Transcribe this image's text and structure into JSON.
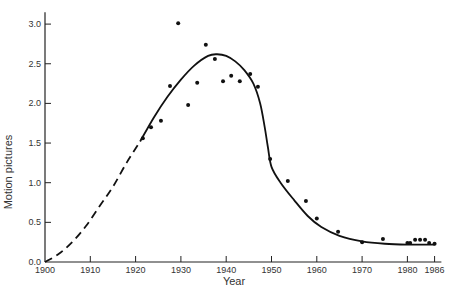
{
  "chart_data": {
    "type": "line",
    "title": "",
    "xlabel": "Year",
    "ylabel": "Motion pictures",
    "xlim": [
      1900,
      1987
    ],
    "ylim": [
      0,
      3.1
    ],
    "grid": false,
    "legend": null,
    "x_ticks": [
      1900,
      1910,
      1920,
      1930,
      1940,
      1950,
      1960,
      1970,
      1980,
      1986
    ],
    "x_tick_labels": [
      "1900",
      "1910",
      "1920",
      "1930",
      "1940",
      "1950",
      "1960",
      "1970",
      "1980",
      "1986"
    ],
    "y_ticks": [
      0.0,
      0.5,
      1.0,
      1.5,
      2.0,
      2.5,
      3.0
    ],
    "y_tick_labels": [
      "0.0",
      "0.5",
      "1.0",
      "1.5",
      "2.0",
      "2.5",
      "3.0"
    ],
    "series": [
      {
        "name": "observed",
        "style": "scatter",
        "x": [
          1921.6,
          1923.4,
          1925.6,
          1927.6,
          1929.4,
          1931.6,
          1933.6,
          1935.5,
          1937.5,
          1939.3,
          1941.1,
          1943.0,
          1945.3,
          1947.0,
          1949.7,
          1953.6,
          1957.6,
          1960.0,
          1964.7,
          1970.0,
          1974.6,
          1980.0,
          1980.6,
          1981.7,
          1982.8,
          1983.9,
          1984.8,
          1986.0
        ],
        "y": [
          1.56,
          1.7,
          1.78,
          2.22,
          3.01,
          1.98,
          2.26,
          2.74,
          2.56,
          2.28,
          2.35,
          2.28,
          2.37,
          2.21,
          1.3,
          1.02,
          0.77,
          0.55,
          0.38,
          0.25,
          0.29,
          0.24,
          0.24,
          0.28,
          0.28,
          0.28,
          0.24,
          0.23
        ]
      },
      {
        "name": "fitted curve (extrapolated)",
        "style": "dashed",
        "x": [
          1900,
          1903,
          1906,
          1909,
          1912,
          1915,
          1918,
          1921
        ],
        "y": [
          0.0,
          0.1,
          0.25,
          0.45,
          0.7,
          0.95,
          1.25,
          1.52
        ]
      },
      {
        "name": "fitted curve",
        "style": "solid",
        "x": [
          1921,
          1924,
          1927,
          1930,
          1933,
          1936,
          1938,
          1940,
          1942,
          1944,
          1946,
          1947.5,
          1948.5,
          1949.2,
          1950,
          1952,
          1955,
          1958,
          1961,
          1965,
          1970,
          1975,
          1980,
          1986
        ],
        "y": [
          1.52,
          1.82,
          2.08,
          2.3,
          2.48,
          2.6,
          2.62,
          2.6,
          2.53,
          2.42,
          2.25,
          2.0,
          1.7,
          1.45,
          1.2,
          1.0,
          0.78,
          0.58,
          0.44,
          0.33,
          0.26,
          0.23,
          0.22,
          0.22
        ]
      }
    ]
  }
}
